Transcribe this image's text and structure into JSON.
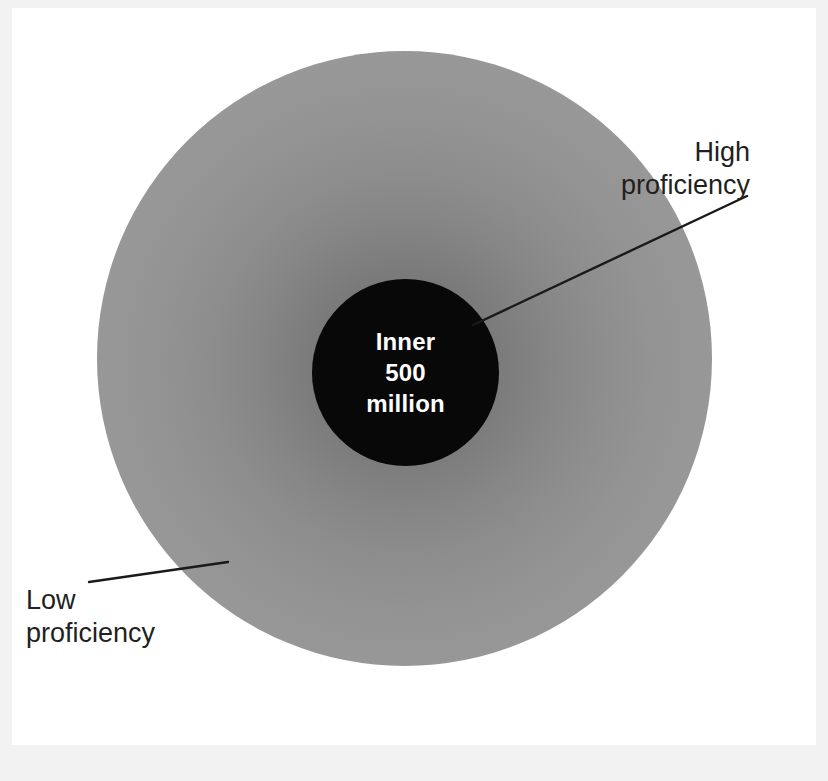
{
  "diagram": {
    "type": "concentric-circle-gradient",
    "title_text_visible": false,
    "inner_circle": {
      "label": "Inner\n500\nmillion",
      "fill_color": "#080808",
      "text_color": "#ffffff"
    },
    "outer_circle": {
      "gradient_center_color": "#6e6e6e",
      "gradient_edge_color": "#9d9d9d"
    },
    "annotations": [
      {
        "id": "high",
        "label": "High\nproficiency",
        "color": "#231f20",
        "points_to": "inner-circle-edge"
      },
      {
        "id": "low",
        "label": "Low\nproficiency",
        "color": "#231f20",
        "points_to": "outer-circle-edge"
      }
    ],
    "background_color": "#ffffff",
    "frame_color": "#f2f2f2",
    "leader_line_color": "#1a1a1a"
  }
}
